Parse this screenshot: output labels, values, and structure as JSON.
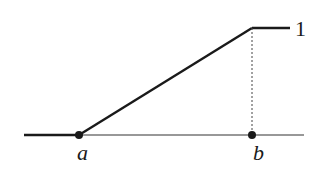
{
  "diagram": {
    "type": "piecewise-linear-function",
    "colors": {
      "line": "#1a1a1a",
      "axis": "#333333",
      "dashed": "#444444",
      "background": "#ffffff"
    },
    "labels": {
      "point_a": "a",
      "point_b": "b",
      "top_value": "1"
    },
    "points": {
      "a": {
        "x": 79,
        "y": 135
      },
      "b": {
        "x": 252,
        "y": 135
      },
      "top": {
        "x": 252,
        "y": 28
      }
    }
  }
}
